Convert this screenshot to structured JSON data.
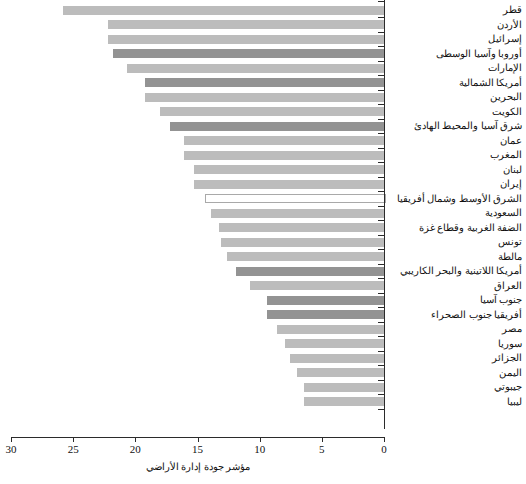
{
  "chart_data": {
    "type": "bar",
    "orientation": "horizontal",
    "title": "",
    "xlabel": "مؤشر جودة إدارة الأراضي",
    "ylabel": "",
    "xlim": [
      30,
      0
    ],
    "x_axis_reversed": true,
    "grid": false,
    "legend": "none",
    "xticks": [
      30,
      25,
      20,
      15,
      10,
      5,
      0
    ],
    "xticklabels": [
      "30",
      "25",
      "20",
      "15",
      "10",
      "5",
      "0"
    ],
    "categories": [
      "قطر",
      "الأردن",
      "إسرائيل",
      "أوروبا وآسيا الوسطى",
      "الإمارات",
      "أمريكا الشمالية",
      "البحرين",
      "الكويت",
      "شرق آسيا والمحيط الهادئ",
      "عمان",
      "المغرب",
      "لبنان",
      "إيران",
      "الشرق الأوسط وشمال أفريقيا",
      "السعودية",
      "الضفة الغربية وقطاع غزة",
      "تونس",
      "مالطة",
      "أمريكا اللاتينية والبحر الكاريبي",
      "العراق",
      "جنوب آسيا",
      "أفريقيا جنوب الصحراء",
      "مصر",
      "سوريا",
      "الجزائر",
      "اليمن",
      "جيبوتي",
      "ليبيا"
    ],
    "values": [
      25.8,
      22.2,
      22.2,
      21.8,
      20.7,
      19.2,
      19.2,
      18.0,
      17.2,
      16.1,
      16.1,
      15.3,
      15.3,
      14.4,
      13.9,
      13.3,
      13.1,
      12.6,
      11.9,
      10.8,
      9.4,
      9.4,
      8.6,
      8.0,
      7.6,
      7.0,
      6.4,
      6.4
    ],
    "bar_styles": [
      "light",
      "light",
      "light",
      "dark",
      "light",
      "dark",
      "light",
      "light",
      "dark",
      "light",
      "light",
      "light",
      "light",
      "hollow",
      "light",
      "light",
      "light",
      "light",
      "dark",
      "light",
      "dark",
      "dark",
      "light",
      "light",
      "light",
      "light",
      "light",
      "light"
    ],
    "colors": {
      "light": "#bcbcbc",
      "dark": "#939393",
      "hollow_fill": "#ffffff",
      "hollow_border": "#a9a9a9",
      "axis": "#2b2b2b",
      "text": "#111111"
    }
  }
}
